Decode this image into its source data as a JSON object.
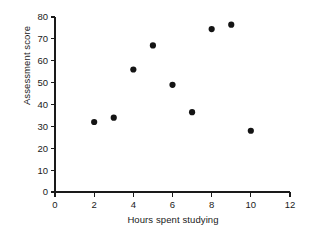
{
  "chart_data": {
    "type": "scatter",
    "title": "",
    "xlabel": "Hours spent studying",
    "ylabel": "Assessment score",
    "xlim": [
      0,
      12
    ],
    "ylim": [
      0,
      80
    ],
    "xticks": [
      0,
      2,
      4,
      6,
      8,
      10,
      12
    ],
    "yticks": [
      0,
      10,
      20,
      30,
      40,
      50,
      60,
      70,
      80
    ],
    "xtick_labels": [
      "0",
      "2",
      "4",
      "6",
      "8",
      "10",
      "12"
    ],
    "ytick_labels": [
      "0",
      "10",
      "20",
      "30",
      "40",
      "50",
      "60",
      "70",
      "80"
    ],
    "grid": false,
    "legend": false,
    "marker": "circle",
    "marker_color": "#141414",
    "axis_color": "#1a1a1a",
    "background_color": "#ffffff",
    "series": [
      {
        "name": "students",
        "points": [
          {
            "x": 2,
            "y": 32
          },
          {
            "x": 3,
            "y": 34
          },
          {
            "x": 4,
            "y": 56
          },
          {
            "x": 5,
            "y": 67
          },
          {
            "x": 6,
            "y": 49
          },
          {
            "x": 7,
            "y": 36.5
          },
          {
            "x": 8,
            "y": 74.5
          },
          {
            "x": 9,
            "y": 76.5
          },
          {
            "x": 10,
            "y": 28
          }
        ]
      }
    ]
  }
}
